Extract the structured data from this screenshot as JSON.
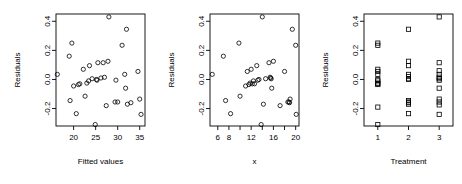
{
  "figure": {
    "type": "multi-panel-scatter",
    "panel_count": 3,
    "background_color": "#ffffff",
    "marker_color": "#000000",
    "axis_color": "#000000"
  },
  "chart_data": [
    {
      "type": "scatter",
      "title": "",
      "xlabel": "Fitted values",
      "ylabel": "Residuals",
      "xlim": [
        16.0,
        36.2
      ],
      "ylim": [
        -0.32,
        0.45
      ],
      "xticks": [
        20,
        25,
        30,
        35
      ],
      "xtick_labels": [
        "20",
        "25",
        "30",
        "35"
      ],
      "yticks": [
        -0.2,
        0.0,
        0.2,
        0.4
      ],
      "ytick_labels": [
        "-0.2",
        "0.0",
        "0.2",
        "0.4"
      ],
      "grid": false,
      "legend": "none",
      "marker": "circle",
      "x": [
        16.3,
        19.0,
        19.2,
        19.6,
        20.0,
        20.6,
        21.1,
        21.4,
        22.2,
        22.6,
        23.0,
        23.4,
        23.6,
        24.2,
        24.9,
        25.2,
        25.3,
        25.5,
        26.2,
        26.7,
        27.0,
        27.4,
        27.8,
        28.0,
        29.4,
        29.6,
        30.0,
        31.0,
        31.6,
        31.8,
        32.0,
        32.2,
        33.0,
        34.6,
        35.0,
        35.3
      ],
      "y": [
        0.035,
        0.16,
        -0.145,
        0.25,
        -0.045,
        -0.235,
        -0.035,
        -0.03,
        0.07,
        -0.115,
        -0.025,
        -0.01,
        0.095,
        0.005,
        -0.31,
        0.0,
        -0.005,
        0.115,
        0.01,
        0.115,
        0.015,
        -0.18,
        0.125,
        0.43,
        -0.155,
        -0.005,
        -0.155,
        0.235,
        0.035,
        -0.06,
        0.345,
        -0.17,
        -0.16,
        0.055,
        -0.135,
        -0.24
      ]
    },
    {
      "type": "scatter",
      "title": "",
      "xlabel": "x",
      "ylabel": "Residuals",
      "xlim": [
        4.6,
        20.6
      ],
      "ylim": [
        -0.32,
        0.45
      ],
      "xticks": [
        6,
        8,
        10,
        12,
        14,
        16,
        18,
        20
      ],
      "xtick_labels": [
        "6",
        "8",
        "",
        "12",
        "",
        "16",
        "",
        "20"
      ],
      "yticks": [
        -0.2,
        0.0,
        0.2,
        0.4
      ],
      "ytick_labels": [
        "-0.2",
        "0.0",
        "0.2",
        "0.4"
      ],
      "grid": false,
      "legend": "none",
      "marker": "circle",
      "x": [
        5.0,
        7.0,
        7.4,
        8.3,
        9.8,
        10.0,
        11.0,
        11.3,
        11.6,
        11.8,
        12.0,
        12.2,
        12.4,
        12.6,
        13.0,
        13.2,
        13.4,
        13.8,
        14.0,
        14.2,
        14.6,
        15.2,
        15.4,
        15.5,
        15.6,
        15.7,
        16.0,
        17.2,
        18.0,
        18.6,
        18.8,
        18.9,
        19.0,
        19.4,
        20.0,
        20.1
      ],
      "y": [
        0.035,
        0.16,
        -0.145,
        -0.235,
        0.25,
        -0.115,
        -0.045,
        0.055,
        -0.035,
        -0.025,
        0.07,
        -0.03,
        -0.01,
        -0.03,
        0.095,
        -0.005,
        0.0,
        -0.31,
        0.43,
        -0.17,
        0.005,
        0.115,
        0.015,
        0.01,
        0.005,
        -0.06,
        0.125,
        -0.18,
        0.055,
        -0.155,
        -0.155,
        -0.16,
        -0.135,
        0.345,
        0.235,
        -0.24
      ]
    },
    {
      "type": "scatter",
      "title": "",
      "xlabel": "Treatment",
      "ylabel": "Residuals",
      "xlim": [
        0.55,
        3.45
      ],
      "ylim": [
        -0.32,
        0.45
      ],
      "xticks": [
        1,
        2,
        3
      ],
      "xtick_labels": [
        "1",
        "2",
        "3"
      ],
      "yticks": [
        -0.2,
        0.0,
        0.2,
        0.4
      ],
      "ytick_labels": [
        "-0.2",
        "0.0",
        "0.2",
        "0.4"
      ],
      "grid": false,
      "legend": "none",
      "marker": "square",
      "x": [
        1,
        1,
        1,
        1,
        1,
        1,
        1,
        1,
        1,
        1,
        1,
        1,
        2,
        2,
        2,
        2,
        2,
        2,
        2,
        2,
        2,
        2,
        2,
        2,
        3,
        3,
        3,
        3,
        3,
        3,
        3,
        3,
        3,
        3,
        3,
        3
      ],
      "y": [
        0.25,
        0.235,
        0.07,
        0.055,
        0.035,
        0.0,
        -0.01,
        -0.025,
        -0.03,
        -0.035,
        -0.19,
        -0.31,
        0.345,
        0.125,
        0.095,
        0.035,
        0.02,
        0.005,
        0.0,
        -0.145,
        -0.155,
        -0.16,
        -0.17,
        -0.235,
        0.43,
        0.115,
        0.06,
        0.035,
        0.015,
        0.005,
        -0.005,
        -0.06,
        -0.135,
        -0.155,
        -0.175,
        -0.24
      ]
    }
  ]
}
